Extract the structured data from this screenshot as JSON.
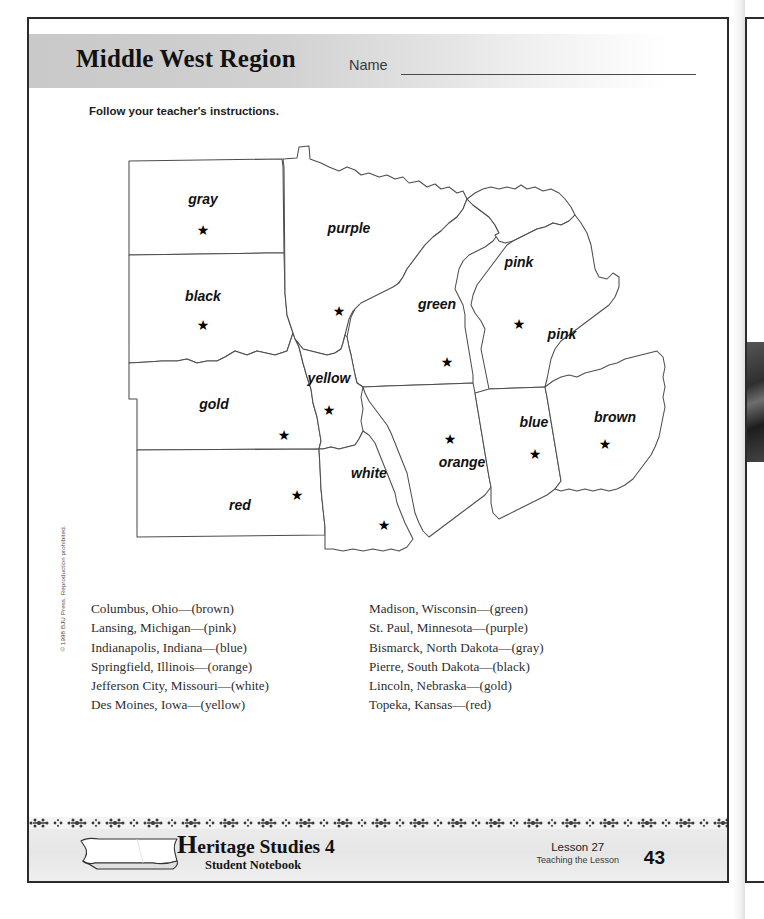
{
  "header": {
    "title": "Middle West Region",
    "name_label": "Name",
    "instructions": "Follow your teacher's instructions."
  },
  "copyright": "© 1998 BJU Press. Reproduction prohibited.",
  "map": {
    "star_glyph": "★",
    "states": [
      {
        "id": "north-dakota",
        "label": "gray",
        "label_x": 96,
        "label_y": 67,
        "star_x": 96,
        "star_y": 97
      },
      {
        "id": "south-dakota",
        "label": "black",
        "label_x": 96,
        "label_y": 164,
        "star_x": 96,
        "star_y": 192
      },
      {
        "id": "nebraska",
        "label": "gold",
        "label_x": 107,
        "label_y": 272,
        "star_x": 177,
        "star_y": 302
      },
      {
        "id": "kansas",
        "label": "red",
        "label_x": 133,
        "label_y": 373,
        "star_x": 206,
        "star_y": 366
      },
      {
        "id": "minnesota",
        "label": "purple",
        "label_x": 242,
        "label_y": 96,
        "star_x": 232,
        "star_y": 177
      },
      {
        "id": "iowa",
        "label": "yellow",
        "label_x": 222,
        "label_y": 246,
        "star_x": 222,
        "star_y": 277
      },
      {
        "id": "missouri",
        "label": "white",
        "label_x": 268,
        "label_y": 341,
        "star_x": 207,
        "star_y": 366
      },
      {
        "id": "wisconsin",
        "label": "green",
        "label_x": 330,
        "label_y": 172,
        "star_x": 340,
        "star_y": 228
      },
      {
        "id": "upper-michigan",
        "label": "pink",
        "label_x": 404,
        "label_y": 130,
        "star_x": 0,
        "star_y": 0
      },
      {
        "id": "michigan",
        "label": "pink",
        "label_x": 455,
        "label_y": 200,
        "star_x": 462,
        "star_y": 252
      },
      {
        "id": "illinois",
        "label": "orange",
        "label_x": 355,
        "label_y": 330,
        "star_x": 343,
        "star_y": 305
      },
      {
        "id": "indiana",
        "label": "blue",
        "label_x": 433,
        "label_y": 288,
        "star_x": 436,
        "star_y": 317
      },
      {
        "id": "ohio",
        "label": "brown",
        "label_x": 512,
        "label_y": 285,
        "star_x": 512,
        "star_y": 312
      }
    ]
  },
  "capitals": {
    "left_column": [
      "Columbus, Ohio—(brown)",
      "Lansing, Michigan—(pink)",
      "Indianapolis, Indiana—(blue)",
      "Springfield, Illinois—(orange)",
      "Jefferson City, Missouri—(white)",
      "Des Moines, Iowa—(yellow)"
    ],
    "right_column": [
      "Madison, Wisconsin—(green)",
      "St. Paul, Minnesota—(purple)",
      "Bismarck, North Dakota—(gray)",
      "Pierre, South Dakota—(black)",
      "Lincoln, Nebraska—(gold)",
      "Topeka, Kansas—(red)"
    ]
  },
  "footer": {
    "brand_initial": "H",
    "brand_rest": "eritage Studies 4",
    "brand_subtitle": "Student Notebook",
    "lesson": "Lesson 27",
    "lesson_sub": "Teaching the Lesson",
    "page_number": "43"
  }
}
